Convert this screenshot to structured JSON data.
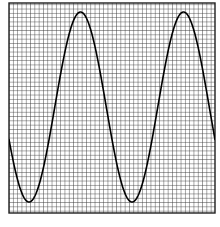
{
  "figure": {
    "title": "",
    "background_color": "#ffffff",
    "width": 220,
    "height": 227
  },
  "grid": {
    "name": "graph-paper-grid",
    "left": 9,
    "top": 3,
    "right": 215,
    "bottom": 213,
    "cell_size": 4.3,
    "line_color": "#3a3a3a",
    "line_width": 0.9,
    "border_color": "#1e1e1e",
    "border_width": 1.4,
    "cell_fill": "#ffffff"
  },
  "chart_data": {
    "type": "line",
    "title": "",
    "subtitle": "",
    "xlabel": "",
    "ylabel": "",
    "grid": true,
    "legend_position": "none",
    "annotations": [],
    "axis": {
      "x_tick_labels": [],
      "y_tick_labels": [],
      "xlim": [
        0,
        220
      ],
      "ylim": [
        -1.1,
        1.1
      ]
    },
    "series": [
      {
        "name": "sine-wave",
        "color": "#000000",
        "line_width": 1.6,
        "waveform": "sine",
        "amplitude_px": 95,
        "midline_y_px": 107,
        "period_px": 103,
        "peak_y_px": 12,
        "trough_y_px": 202,
        "x_start_px": 9,
        "x_end_px": 215,
        "phase_deg": 200,
        "key_points": [
          {
            "label": "left-edge-entry",
            "x": 9,
            "y": 104
          },
          {
            "label": "trough-1",
            "x": 40,
            "y": 202
          },
          {
            "label": "rising-zero-crossing-1",
            "x": 64,
            "y": 107
          },
          {
            "label": "peak-1",
            "x": 87,
            "y": 12
          },
          {
            "label": "falling-zero-crossing-1",
            "x": 115,
            "y": 107
          },
          {
            "label": "trough-2",
            "x": 143,
            "y": 202
          },
          {
            "label": "rising-zero-crossing-2",
            "x": 167,
            "y": 107
          },
          {
            "label": "peak-2",
            "x": 190,
            "y": 12
          },
          {
            "label": "right-edge-exit",
            "x": 215,
            "y": 112
          }
        ],
        "x": [
          9,
          14,
          19,
          24,
          29,
          34,
          40,
          46,
          52,
          58,
          64,
          70,
          76,
          82,
          87,
          93,
          99,
          105,
          110,
          115,
          121,
          127,
          133,
          138,
          143,
          149,
          155,
          161,
          167,
          173,
          179,
          185,
          190,
          196,
          202,
          208,
          215
        ],
        "y": [
          104,
          137,
          166,
          186,
          198,
          203,
          202,
          193,
          176,
          153,
          126,
          97,
          68,
          42,
          22,
          14,
          13,
          23,
          45,
          72,
          101,
          130,
          158,
          181,
          196,
          203,
          201,
          190,
          171,
          146,
          117,
          87,
          59,
          34,
          18,
          12,
          16
        ]
      }
    ]
  }
}
